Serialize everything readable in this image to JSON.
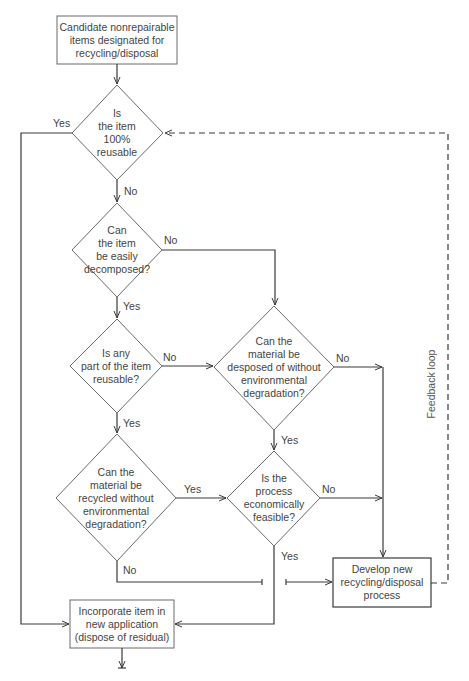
{
  "nodes": {
    "start": "Candidate nonrepairable\nitems designated for\nrecycling/disposal",
    "q_reusable": "Is\nthe item\n100%\nreusable",
    "q_decompose": "Can\nthe item\nbe easily\ndecomposed?",
    "q_part_reusable": "Is any\npart of the item\nreusable?",
    "q_dispose": "Can the\nmaterial be\ndesposed of without\nenvironmental\ndegradation?",
    "q_recycle": "Can the\nmaterial be\nrecycled without\nenvironmental\ndegradation?",
    "q_economic": "Is the\nprocess\neconomically\nfeasible?",
    "develop": "Develop new\nrecycling/disposal\nprocess",
    "incorporate": "Incorporate item in\nnew application\n(dispose of residual)"
  },
  "edge_labels": {
    "reusable_yes": "Yes",
    "reusable_no": "No",
    "decompose_no": "No",
    "decompose_yes": "Yes",
    "part_no": "No",
    "part_yes": "Yes",
    "dispose_no": "No",
    "dispose_yes": "Yes",
    "recycle_yes": "Yes",
    "recycle_no": "No",
    "economic_no": "No",
    "economic_yes": "Yes"
  },
  "feedback_label": "Feedback loop",
  "colors": {
    "line": "#3a3a3a",
    "shape": "#6a6a6a"
  }
}
